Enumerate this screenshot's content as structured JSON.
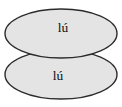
{
  "canvas": {
    "width": 122,
    "height": 107,
    "background_color": "#ffffff"
  },
  "style": {
    "ellipse_fill": "#e4e4e4",
    "ellipse_stroke": "#2b2b2b",
    "label_color": "#111111"
  },
  "diagram": {
    "type": "two-overlapping-ellipses",
    "shapes": [
      {
        "name": "top-ellipse",
        "label": "lú",
        "cx": 61,
        "cy": 33.5,
        "rx": 56,
        "ry": 24.5,
        "label_x": 63,
        "label_y": 29
      },
      {
        "name": "bottom-ellipse",
        "label": "lú",
        "cx": 61,
        "cy": 74.5,
        "rx": 56,
        "ry": 24.5,
        "label_x": 58,
        "label_y": 77
      }
    ]
  }
}
